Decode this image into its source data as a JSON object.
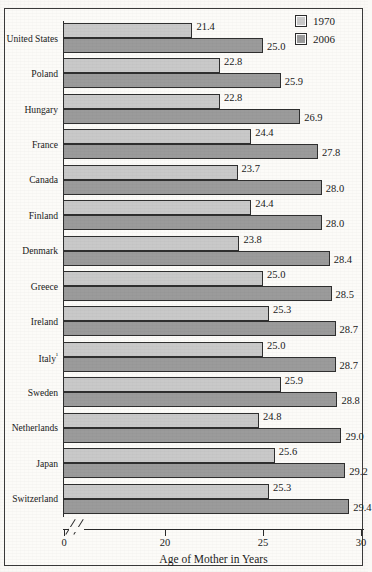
{
  "page": {
    "cutoff_text": "",
    "background_color": "#faf9f6"
  },
  "legend": {
    "items": [
      {
        "label": "1970",
        "color": "#c9c9c9",
        "swatch_name": "legend-swatch-1970"
      },
      {
        "label": "2006",
        "color": "#9b9b9b",
        "swatch_name": "legend-swatch-2006"
      }
    ]
  },
  "axis": {
    "title": "Age of Mother in Years",
    "ticks": [
      "0",
      "20",
      "25",
      "30"
    ],
    "break_marker": "//"
  },
  "chart_data": {
    "type": "bar",
    "orientation": "horizontal",
    "title": "",
    "xlabel": "Age of Mother in Years",
    "ylabel": "",
    "xlim": [
      19,
      30
    ],
    "axis_break": true,
    "axis_break_after": 0,
    "xticks": [
      0,
      20,
      25,
      30
    ],
    "grid": false,
    "legend_position": "top-right",
    "categories": [
      "United States",
      "Poland",
      "Hungary",
      "France",
      "Canada",
      "Finland",
      "Denmark",
      "Greece",
      "Ireland",
      "Italy",
      "Sweden",
      "Netherlands",
      "Japan",
      "Switzerland"
    ],
    "category_labels": [
      "United States",
      "Poland",
      "Hungary",
      "France",
      "Canada",
      "Finland",
      "Denmark",
      "Greece",
      "Ireland",
      "Italy¹",
      "Sweden",
      "Netherlands",
      "Japan",
      "Switzerland"
    ],
    "series": [
      {
        "name": "1970",
        "color": "#c9c9c9",
        "values": [
          21.4,
          22.8,
          22.8,
          24.4,
          23.7,
          24.4,
          23.8,
          25.0,
          25.3,
          25.0,
          25.9,
          24.8,
          25.6,
          25.3
        ],
        "labels": [
          "21.4",
          "22.8",
          "22.8",
          "24.4",
          "23.7",
          "24.4",
          "23.8",
          "25.0",
          "25.3",
          "25.0",
          "25.9",
          "24.8",
          "25.6",
          "25.3"
        ]
      },
      {
        "name": "2006",
        "color": "#9b9b9b",
        "values": [
          25.0,
          25.9,
          26.9,
          27.8,
          28.0,
          28.0,
          28.4,
          28.5,
          28.7,
          28.7,
          28.8,
          29.0,
          29.2,
          29.4
        ],
        "labels": [
          "25.0",
          "25.9",
          "26.9",
          "27.8",
          "28.0",
          "28.0",
          "28.4",
          "28.5",
          "28.7",
          "28.7",
          "28.8",
          "29.0",
          "29.2",
          "29.4"
        ]
      }
    ]
  }
}
